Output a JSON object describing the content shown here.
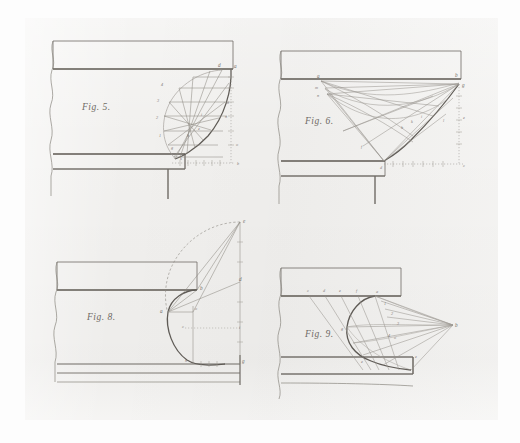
{
  "document": {
    "type": "engraved-plate",
    "medium": "scanned antique technical plate",
    "sheet_color": "#f1f0ee",
    "ink_color": "#6f6b65",
    "faint_ink_color": "#9a9690",
    "page_background": "#fdfdfd"
  },
  "figures": [
    {
      "id": "fig5",
      "caption": "Fig. 5.",
      "description": "Hatched ogee curve springing from a cornice, with chorded construction lines",
      "point_labels": [
        "d",
        "a",
        "e",
        "n",
        "h",
        "m",
        "i",
        "g",
        "k",
        "o",
        "b"
      ],
      "numbered_stations": [
        "4",
        "3",
        "2",
        "1"
      ],
      "axes": {
        "vertical_label": "o",
        "horizontal_label": "b"
      }
    },
    {
      "id": "fig6",
      "caption": "Fig. 6.",
      "description": "Radiating tangent construction of a concave cyma from points a, m, n to the profile at g",
      "point_labels": [
        "a",
        "m",
        "n",
        "b",
        "g",
        "e",
        "h",
        "k",
        "i",
        "l",
        "f",
        "c",
        "d"
      ],
      "axes": {
        "vertical_label": "e",
        "horizontal_label": "c"
      }
    },
    {
      "id": "fig8",
      "caption": "Fig. 8.",
      "description": "Quarter-round profile with circumscribed arc, radius lines and projection square",
      "point_labels": [
        "e",
        "b",
        "d",
        "a",
        "o",
        "c",
        "i",
        "h",
        "g"
      ]
    },
    {
      "id": "fig9",
      "caption": "Fig. 9.",
      "description": "Ovolo struck by converging rays from a focal point c to stations along the soffit",
      "point_labels": [
        "c",
        "d",
        "e",
        "f",
        "a",
        "1",
        "2",
        "3",
        "4",
        "g",
        "o",
        "b",
        "e"
      ],
      "numbered_stations": [
        "1",
        "2",
        "3",
        "4"
      ]
    }
  ]
}
